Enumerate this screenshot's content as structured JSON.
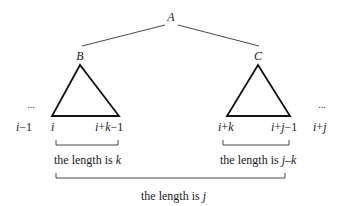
{
  "nodes": {
    "root": "A",
    "left": "B",
    "right": "C"
  },
  "ellipsis": "...",
  "index_labels": {
    "i_minus_1": {
      "var": "i",
      "rest": "−1"
    },
    "i": {
      "var": "i"
    },
    "i_plus_k_minus_1": {
      "a": "i",
      "op1": "+",
      "b": "k",
      "op2": "−1"
    },
    "i_plus_k": {
      "a": "i",
      "op1": "+",
      "b": "k"
    },
    "i_plus_j_minus_1": {
      "a": "i",
      "op1": "+",
      "b": "j",
      "op2": "−1"
    },
    "i_plus_j": {
      "a": "i",
      "op1": "+",
      "b": "j"
    }
  },
  "lengths": {
    "left": {
      "prefix": "the length is ",
      "var": "k"
    },
    "right": {
      "prefix": "the length is ",
      "var": "j–k"
    },
    "total": {
      "prefix": "the length is ",
      "var": "j"
    }
  }
}
